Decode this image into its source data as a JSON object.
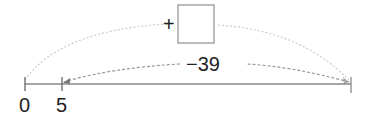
{
  "number_line": {
    "ticks": [
      {
        "value": "0",
        "x": 25
      },
      {
        "value": "5",
        "x": 62
      }
    ],
    "end_x": 351,
    "axis_color": "#888888"
  },
  "operation": {
    "sign": "+",
    "answer_box": "",
    "jump_label": "−39"
  },
  "colors": {
    "upper_arc": "#cccccc",
    "lower_arc": "#999999",
    "text": "#222222"
  }
}
